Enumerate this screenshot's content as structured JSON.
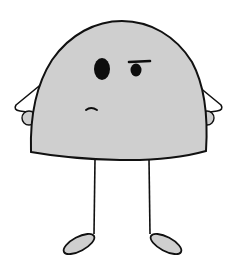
{
  "illustration": {
    "subject": "cartoon character",
    "colors": {
      "background": "#ffffff",
      "body_fill": "#cfcfcf",
      "outline": "#111111",
      "eye": "#0d0d0d",
      "arm_fill": "#ffffff",
      "foot_fill": "#cfcfcf"
    },
    "parts": [
      "head-body",
      "left-eye",
      "right-eye",
      "right-eyebrow",
      "mouth",
      "left-arm",
      "right-arm",
      "left-hand",
      "right-hand",
      "left-leg",
      "right-leg",
      "left-foot",
      "right-foot"
    ]
  }
}
